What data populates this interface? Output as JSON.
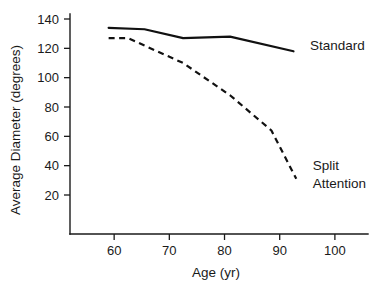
{
  "chart_data": {
    "type": "line",
    "title": "",
    "xlabel": "Age (yr)",
    "ylabel": "Average Diameter (degrees)",
    "xlim": [
      52,
      106
    ],
    "ylim": [
      0,
      148
    ],
    "xticks": [
      60,
      70,
      80,
      90,
      100
    ],
    "xtick_labels": [
      "60",
      "70",
      "80",
      "90",
      "100"
    ],
    "yticks": [
      20,
      40,
      60,
      80,
      100,
      120,
      140
    ],
    "ytick_labels": [
      "20",
      "40",
      "60",
      "80",
      "100",
      "120",
      "140"
    ],
    "grid": false,
    "legend_position": "inline-right-of-series",
    "series": [
      {
        "name": "Standard",
        "style": "solid",
        "label_lines": [
          "Standard"
        ],
        "x": [
          59,
          65.5,
          72.5,
          81,
          92.5
        ],
        "values": [
          134,
          133,
          127,
          128,
          118
        ]
      },
      {
        "name": "Split Attention",
        "style": "dashed",
        "label_lines": [
          "Split",
          "Attention"
        ],
        "x": [
          59,
          62.5,
          72.5,
          81,
          88.5,
          93
        ],
        "values": [
          127,
          127,
          110,
          88,
          64,
          31
        ]
      }
    ],
    "annotations": [
      {
        "text": "Standard",
        "x": 95.5,
        "y": 119
      },
      {
        "text": "Split",
        "x": 96,
        "y": 37
      },
      {
        "text": "Attention",
        "x": 96,
        "y": 25
      }
    ]
  },
  "axis": {
    "x_title": "Age (yr)",
    "y_title": "Average Diameter (degrees)"
  },
  "labels": {
    "standard": "Standard",
    "split": "Split",
    "attention": "Attention"
  },
  "colors": {
    "line": "#111111",
    "axis": "#1a1a1a",
    "background": "#ffffff"
  }
}
